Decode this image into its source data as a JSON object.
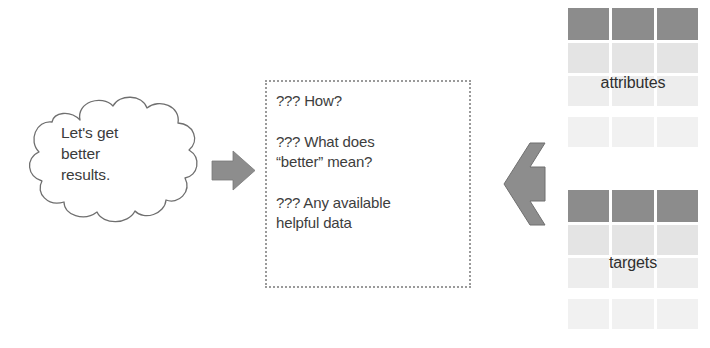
{
  "diagram": {
    "colors": {
      "cloud_outline": "#6f6f6f",
      "arrow_fill": "#8d8d8d",
      "table_header": "#8c8c8c",
      "table_body_light": "#e4e4e4",
      "table_body_lighter": "#ededed",
      "table_body_faint": "#f1f1f1",
      "dotted_border": "#9a9a9a",
      "text": "#3b3b3b"
    }
  },
  "cloud": {
    "name": "thought-cloud",
    "lines": [
      "Let's get",
      "better",
      "results."
    ]
  },
  "flow_arrow": {
    "name": "right-arrow",
    "direction": "right"
  },
  "question_box": {
    "name": "questions-panel",
    "items": [
      {
        "marks": "???",
        "lines": [
          "How?"
        ]
      },
      {
        "marks": "???",
        "lines": [
          "What does",
          "“better” mean?"
        ]
      },
      {
        "marks": "???",
        "lines": [
          "Any available",
          "helpful data"
        ]
      }
    ]
  },
  "merge_arrow": {
    "name": "merge-left-arrow",
    "direction": "left"
  },
  "tables": [
    {
      "name": "attributes-table",
      "label": "attributes",
      "columns": 3,
      "header_row": [
        "",
        "",
        ""
      ],
      "body_rows": [
        {
          "style": "light",
          "cells": [
            "",
            "",
            ""
          ]
        },
        {
          "style": "lighter",
          "cells": [
            "",
            "",
            ""
          ]
        },
        {
          "style": "faint",
          "cells": [
            "",
            "",
            ""
          ]
        }
      ]
    },
    {
      "name": "targets-table",
      "label": "targets",
      "columns": 3,
      "header_row": [
        "",
        "",
        ""
      ],
      "body_rows": [
        {
          "style": "light",
          "cells": [
            "",
            "",
            ""
          ]
        },
        {
          "style": "lighter",
          "cells": [
            "",
            "",
            ""
          ]
        },
        {
          "style": "faint",
          "cells": [
            "",
            "",
            ""
          ]
        }
      ]
    }
  ]
}
